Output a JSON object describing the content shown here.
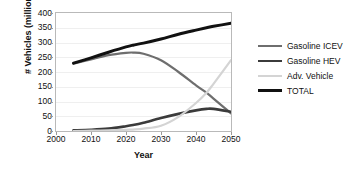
{
  "chart_data": {
    "type": "line",
    "title": "",
    "xlabel": "Year",
    "ylabel": "# Vehicles (millions)",
    "xlim": [
      2000,
      2050
    ],
    "ylim": [
      0,
      400
    ],
    "xticks": [
      2000,
      2010,
      2020,
      2030,
      2040,
      2050
    ],
    "yticks": [
      0,
      50,
      100,
      150,
      200,
      250,
      300,
      350,
      400
    ],
    "grid": true,
    "legend_position": "right",
    "x": [
      2005,
      2010,
      2015,
      2020,
      2022,
      2025,
      2030,
      2035,
      2040,
      2043,
      2045,
      2050
    ],
    "series": [
      {
        "name": "Gasoline ICEV",
        "color": "#6e6e6e",
        "values": [
          228,
          243,
          257,
          265,
          266,
          262,
          240,
          200,
          155,
          130,
          110,
          60
        ]
      },
      {
        "name": "Gasoline HEV",
        "color": "#3b3b3b",
        "values": [
          2,
          4,
          8,
          16,
          20,
          28,
          44,
          58,
          70,
          75,
          75,
          65
        ]
      },
      {
        "name": "Adv. Vehicle",
        "color": "#d4d4d4",
        "values": [
          0,
          1,
          2,
          4,
          5,
          8,
          18,
          48,
          95,
          130,
          160,
          240
        ]
      },
      {
        "name": "TOTAL",
        "color": "#111111",
        "values": [
          230,
          248,
          267,
          285,
          291,
          298,
          312,
          328,
          342,
          350,
          355,
          365
        ]
      }
    ]
  },
  "legend": {
    "items": [
      {
        "label": "Gasoline ICEV",
        "color": "#6e6e6e",
        "width": 2.2
      },
      {
        "label": "Gasoline HEV",
        "color": "#3b3b3b",
        "width": 2.6
      },
      {
        "label": "Adv. Vehicle",
        "color": "#d4d4d4",
        "width": 2.2
      },
      {
        "label": "TOTAL",
        "color": "#111111",
        "width": 3.0
      }
    ]
  }
}
